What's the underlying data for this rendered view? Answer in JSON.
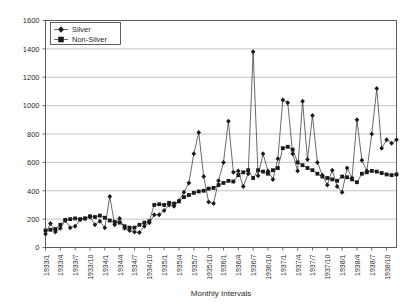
{
  "chart_data": {
    "type": "line",
    "title": "",
    "xlabel": "Monthly Intervals",
    "ylabel": "",
    "ylim": [
      0,
      1600
    ],
    "ytick_step": 200,
    "yticks": [
      0,
      200,
      400,
      600,
      800,
      1000,
      1200,
      1400,
      1600
    ],
    "grid": true,
    "legend_position": "top-left",
    "xtick_labels": [
      "1933/1",
      "1933/4",
      "1933/7",
      "1933/10",
      "1934/1",
      "1934/4",
      "1934/7",
      "1934/10",
      "1935/1",
      "1935/4",
      "1935/7",
      "1935/10",
      "1936/1",
      "1936/4",
      "1936/7",
      "1936/10",
      "1937/1",
      "1937/4",
      "1937/7",
      "1937/10",
      "1938/1",
      "1938/4",
      "1938/7",
      "1938/10"
    ],
    "xtick_indices": [
      0,
      3,
      6,
      9,
      12,
      15,
      18,
      21,
      24,
      27,
      30,
      33,
      36,
      39,
      42,
      45,
      48,
      51,
      54,
      57,
      60,
      63,
      66,
      69
    ],
    "x": [
      "1933/1",
      "1933/2",
      "1933/3",
      "1933/4",
      "1933/5",
      "1933/6",
      "1933/7",
      "1933/8",
      "1933/9",
      "1933/10",
      "1933/11",
      "1933/12",
      "1934/1",
      "1934/2",
      "1934/3",
      "1934/4",
      "1934/5",
      "1934/6",
      "1934/7",
      "1934/8",
      "1934/9",
      "1934/10",
      "1934/11",
      "1934/12",
      "1935/1",
      "1935/2",
      "1935/3",
      "1935/4",
      "1935/5",
      "1935/6",
      "1935/7",
      "1935/8",
      "1935/9",
      "1935/10",
      "1935/11",
      "1935/12",
      "1936/1",
      "1936/2",
      "1936/3",
      "1936/4",
      "1936/5",
      "1936/6",
      "1936/7",
      "1936/8",
      "1936/9",
      "1936/10",
      "1936/11",
      "1936/12",
      "1937/1",
      "1937/2",
      "1937/3",
      "1937/4",
      "1937/5",
      "1937/6",
      "1937/7",
      "1937/8",
      "1937/9",
      "1937/10",
      "1937/11",
      "1937/12",
      "1938/1",
      "1938/2",
      "1938/3",
      "1938/4",
      "1938/5",
      "1938/6",
      "1938/7",
      "1938/8",
      "1938/9",
      "1938/10",
      "1938/11",
      "1938/12"
    ],
    "series": [
      {
        "name": "Silver",
        "marker": "diamond",
        "values": [
          95,
          170,
          110,
          135,
          190,
          140,
          150,
          195,
          205,
          215,
          160,
          185,
          140,
          360,
          160,
          205,
          135,
          120,
          110,
          105,
          150,
          175,
          230,
          230,
          260,
          300,
          290,
          330,
          390,
          455,
          660,
          810,
          500,
          320,
          310,
          470,
          600,
          890,
          530,
          540,
          430,
          520,
          1380,
          505,
          660,
          540,
          480,
          625,
          1040,
          1020,
          660,
          540,
          1030,
          620,
          930,
          600,
          510,
          440,
          545,
          430,
          390,
          560,
          490,
          900,
          615,
          540,
          800,
          1120,
          700,
          760,
          735,
          760
        ]
      },
      {
        "name": "Non-Silver",
        "marker": "square",
        "values": [
          120,
          125,
          130,
          160,
          195,
          200,
          205,
          200,
          205,
          220,
          215,
          225,
          210,
          190,
          180,
          175,
          150,
          140,
          140,
          160,
          175,
          185,
          300,
          305,
          300,
          315,
          310,
          325,
          355,
          370,
          385,
          395,
          400,
          415,
          420,
          440,
          455,
          470,
          465,
          510,
          530,
          545,
          490,
          545,
          535,
          520,
          545,
          560,
          700,
          710,
          690,
          600,
          580,
          560,
          545,
          520,
          500,
          490,
          480,
          470,
          500,
          495,
          480,
          460,
          520,
          530,
          540,
          535,
          525,
          515,
          510,
          515
        ]
      }
    ]
  },
  "legend": {
    "entries": [
      {
        "label": "Silver"
      },
      {
        "label": "Non-Silver"
      }
    ]
  }
}
